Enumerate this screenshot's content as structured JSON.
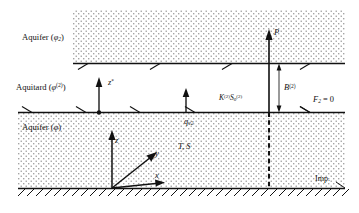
{
  "figure": {
    "kind": "hydrogeology-cross-section",
    "width": 359,
    "height": 213,
    "background_color": "#ffffff",
    "line_color": "#111111",
    "stipple_color": "#8a8a8a"
  },
  "layers": {
    "upper_aquifer": {
      "label_text": "Aquifer (",
      "label_symbol": "φ",
      "label_subscript": "2",
      "label_close": ")",
      "full_label": "Aquifer (φ2)",
      "fill": "stipple"
    },
    "aquitard": {
      "label_text": "Aquitard (",
      "label_symbol": "φ",
      "label_superscript": "(2)",
      "label_close": ")",
      "full_label": "Aquitard (φ(2))",
      "fill": "blank"
    },
    "lower_aquifer": {
      "label_text": "Aquifer (",
      "label_symbol": "φ",
      "label_close": ")",
      "full_label": "Aquifer (φ)",
      "fill": "stipple"
    }
  },
  "annotations": {
    "pumping_arrow_label": "P",
    "aquitard_thickness_label": "B",
    "aquitard_thickness_sup": "(2)",
    "aquitard_props_k": "K",
    "aquitard_props_k_sup": "(2)",
    "aquitard_props_s": "S",
    "aquitard_props_s_sub": "0",
    "aquitard_props_s_sup": "(2)",
    "boundary_condition": "F",
    "boundary_condition_sub": "2",
    "boundary_condition_eq": " = 0",
    "leakage_flux": "q",
    "leakage_flux_sub": "v2",
    "aquifer_props": "T, S",
    "impermeable_base": "Imp.",
    "axis_z_star": "z",
    "axis_z_star_sup": "*",
    "axis_z": "z",
    "axis_y": "y",
    "axis_x": "x"
  }
}
